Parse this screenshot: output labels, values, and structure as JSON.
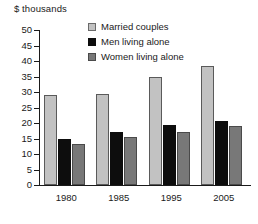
{
  "chart_data": {
    "type": "bar",
    "title": "$ thousands",
    "xlabel": "",
    "ylabel": "",
    "ylim": [
      0,
      50
    ],
    "ytick_step": 5,
    "yticks": [
      50,
      45,
      40,
      35,
      30,
      25,
      20,
      15,
      10,
      5,
      0
    ],
    "grid": false,
    "legend_position": "inside-top-right",
    "categories": [
      "1980",
      "1985",
      "1995",
      "2005"
    ],
    "series": [
      {
        "name": "Married couples",
        "color": "#c2c2c2",
        "values": [
          29.0,
          29.5,
          35.0,
          38.5
        ]
      },
      {
        "name": "Men living alone",
        "color": "#0d0d0d",
        "values": [
          14.8,
          17.0,
          19.5,
          20.5
        ]
      },
      {
        "name": "Women living alone",
        "color": "#787878",
        "values": [
          13.3,
          15.4,
          17.0,
          19.0
        ]
      }
    ]
  }
}
